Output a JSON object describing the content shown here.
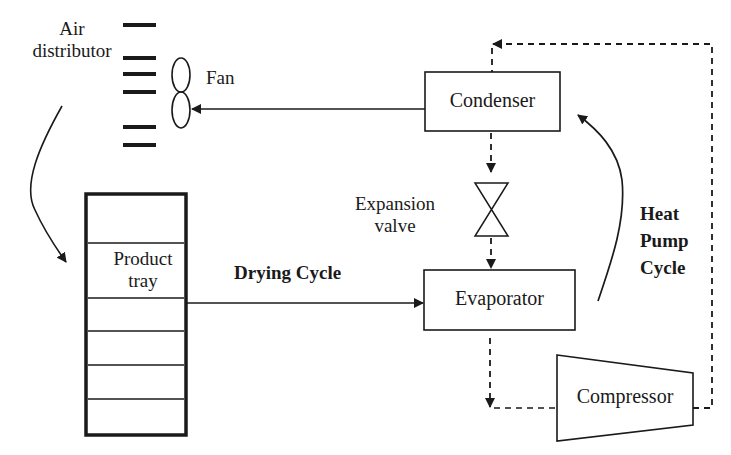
{
  "diagram": {
    "type": "heat pump dryer schematic",
    "labels": {
      "air_distributor_line1": "Air",
      "air_distributor_line2": "distributor",
      "fan": "Fan",
      "condenser": "Condenser",
      "expansion_valve_line1": "Expansion",
      "expansion_valve_line2": "valve",
      "evaporator": "Evaporator",
      "compressor": "Compressor",
      "product_tray_line1": "Product",
      "product_tray_line2": "tray",
      "drying_cycle": "Drying Cycle",
      "heat_pump_line1": "Heat",
      "heat_pump_line2": "Pump",
      "heat_pump_line3": "Cycle"
    },
    "nodes": [
      {
        "id": "air_distributor",
        "label": "Air distributor"
      },
      {
        "id": "fan",
        "label": "Fan"
      },
      {
        "id": "condenser",
        "label": "Condenser"
      },
      {
        "id": "expansion_valve",
        "label": "Expansion valve"
      },
      {
        "id": "evaporator",
        "label": "Evaporator"
      },
      {
        "id": "compressor",
        "label": "Compressor"
      },
      {
        "id": "product_tray",
        "label": "Product tray"
      }
    ],
    "edges": [
      {
        "from": "condenser",
        "to": "fan",
        "style": "solid"
      },
      {
        "from": "air_distributor",
        "to": "product_tray",
        "style": "solid-curved"
      },
      {
        "from": "product_tray",
        "to": "evaporator",
        "style": "solid",
        "label": "Drying Cycle"
      },
      {
        "from": "condenser",
        "to": "expansion_valve",
        "style": "dashed"
      },
      {
        "from": "expansion_valve",
        "to": "evaporator",
        "style": "dashed"
      },
      {
        "from": "evaporator",
        "to": "compressor",
        "style": "dashed"
      },
      {
        "from": "compressor",
        "to": "condenser",
        "style": "dashed"
      },
      {
        "from": "evaporator",
        "to": "condenser",
        "style": "solid-curved",
        "label": "Heat Pump Cycle"
      }
    ],
    "colors": {
      "stroke": "#1a1a1a",
      "background": "#ffffff"
    }
  }
}
